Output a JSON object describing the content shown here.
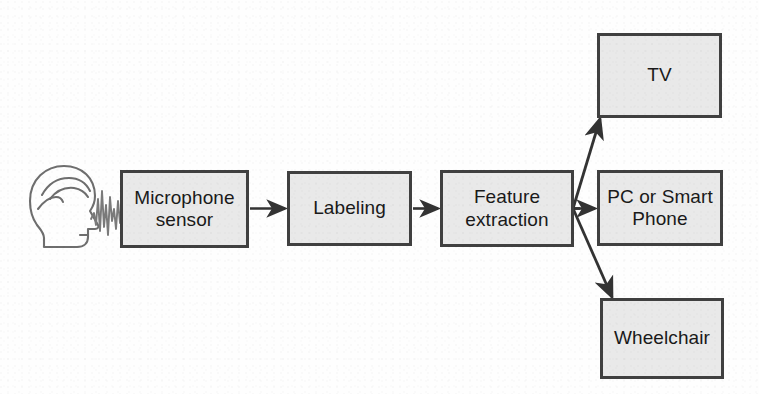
{
  "diagram": {
    "background_color": "#ffffff",
    "node_fill_color": "#e9e9e9",
    "node_border_color": "#404040",
    "edge_color": "#333333",
    "text_color": "#1a1a1a",
    "nodes": [
      {
        "id": "microphone-sensor",
        "label": "Microphone\nsensor"
      },
      {
        "id": "labeling",
        "label": "Labeling"
      },
      {
        "id": "feature-extraction",
        "label": "Feature\nextraction"
      },
      {
        "id": "tv",
        "label": "TV"
      },
      {
        "id": "pc-or-smart-phone",
        "label": "PC or Smart\nPhone"
      },
      {
        "id": "wheelchair",
        "label": "Wheelchair"
      }
    ],
    "edges": [
      {
        "from": "speaker-icon",
        "to": "microphone-sensor",
        "style": "sound-wave"
      },
      {
        "from": "microphone-sensor",
        "to": "labeling",
        "style": "arrow"
      },
      {
        "from": "labeling",
        "to": "feature-extraction",
        "style": "arrow"
      },
      {
        "from": "feature-extraction",
        "to": "tv",
        "style": "arrow"
      },
      {
        "from": "feature-extraction",
        "to": "pc-or-smart-phone",
        "style": "arrow"
      },
      {
        "from": "feature-extraction",
        "to": "wheelchair",
        "style": "arrow"
      }
    ],
    "icons": [
      {
        "id": "speaker-head-icon",
        "description": "head-profile-with-soundwave"
      }
    ]
  }
}
